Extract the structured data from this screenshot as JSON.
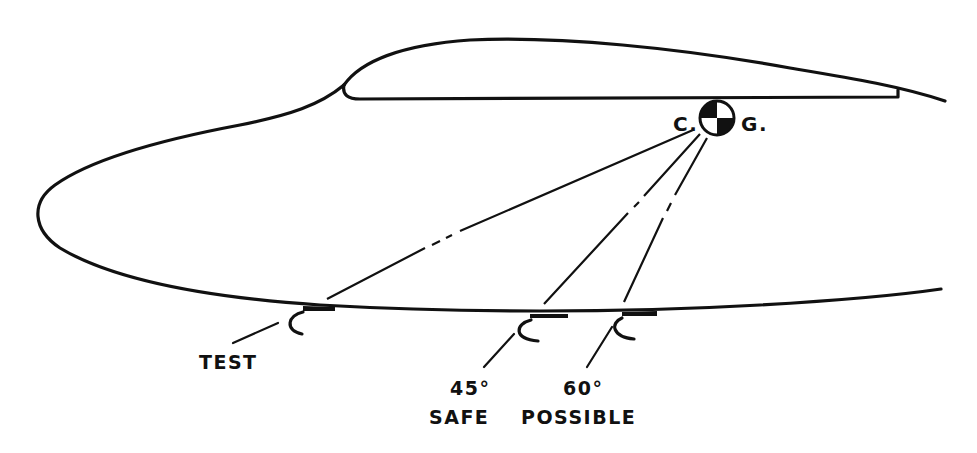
{
  "diagram": {
    "colors": {
      "ink": "#111111",
      "background": "#ffffff"
    },
    "cg_marker": {
      "label_left": "C.",
      "label_right": "G.",
      "icon": "center-of-gravity-icon"
    },
    "positions": [
      {
        "id": "test",
        "angle": "",
        "label": "TEST"
      },
      {
        "id": "safe",
        "angle": "45°",
        "label": "SAFE"
      },
      {
        "id": "possible",
        "angle": "60°",
        "label": "POSSIBLE"
      }
    ]
  }
}
